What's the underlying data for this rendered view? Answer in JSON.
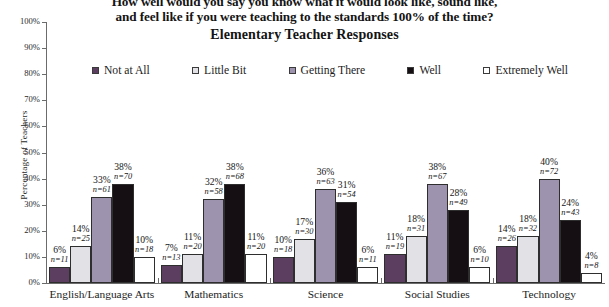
{
  "chart_data": {
    "type": "bar",
    "title_lines": [
      "How well would you say you know what it would look like, sound like,",
      "and feel like if you were teaching to the standards 100% of the time?"
    ],
    "subtitle": "Elementary Teacher Responses",
    "xlabel": "",
    "ylabel": "Percentage of Teachers",
    "ylim": [
      0,
      100
    ],
    "ytick_labels": [
      "100%",
      "90%",
      "80%",
      "70%",
      "60%",
      "50%",
      "40%",
      "30%",
      "20%",
      "10%",
      "0%"
    ],
    "ytick_values": [
      100,
      90,
      80,
      70,
      60,
      50,
      40,
      30,
      20,
      10,
      0
    ],
    "grid": false,
    "legend_position": "top",
    "categories": [
      "English/Language Arts",
      "Mathematics",
      "Science",
      "Social Studies",
      "Technology"
    ],
    "series": [
      {
        "name": "Not at All",
        "color": "#5c3f60",
        "values": [
          6,
          7,
          10,
          11,
          14
        ],
        "counts": [
          11,
          13,
          18,
          19,
          26
        ],
        "labels_pct": [
          "6%",
          "7%",
          "10%",
          "11%",
          "14%"
        ],
        "labels_n": [
          "n=11",
          "n=13",
          "n=18",
          "n=19",
          "n=26"
        ]
      },
      {
        "name": "Little Bit",
        "color": "#e2e1e6",
        "values": [
          14,
          11,
          17,
          18,
          18
        ],
        "counts": [
          25,
          20,
          30,
          31,
          32
        ],
        "labels_pct": [
          "14%",
          "11%",
          "17%",
          "18%",
          "18%"
        ],
        "labels_n": [
          "n=25",
          "n=20",
          "n=30",
          "n=31",
          "n=32"
        ]
      },
      {
        "name": "Getting There",
        "color": "#9e93ae",
        "values": [
          33,
          32,
          36,
          38,
          40
        ],
        "counts": [
          61,
          58,
          63,
          67,
          72
        ],
        "labels_pct": [
          "33%",
          "32%",
          "36%",
          "38%",
          "40%"
        ],
        "labels_n": [
          "n=61",
          "n=58",
          "n=63",
          "n=67",
          "n=72"
        ]
      },
      {
        "name": "Well",
        "color": "#150f14",
        "values": [
          38,
          38,
          31,
          28,
          24
        ],
        "counts": [
          70,
          68,
          54,
          49,
          43
        ],
        "labels_pct": [
          "38%",
          "38%",
          "31%",
          "28%",
          "24%"
        ],
        "labels_n": [
          "n=70",
          "n=68",
          "n=54",
          "n=49",
          "n=43"
        ]
      },
      {
        "name": "Extremely Well",
        "color": "#ffffff",
        "values": [
          10,
          11,
          6,
          6,
          4
        ],
        "counts": [
          18,
          20,
          11,
          10,
          8
        ],
        "labels_pct": [
          "10%",
          "11%",
          "6%",
          "6%",
          "4%"
        ],
        "labels_n": [
          "n=18",
          "n=20",
          "n=11",
          "n=10",
          "n=8"
        ]
      }
    ]
  }
}
